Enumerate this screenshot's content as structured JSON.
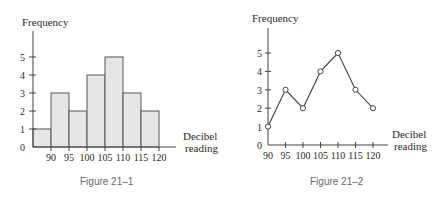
{
  "chart_data": [
    {
      "type": "bar",
      "subtype": "histogram",
      "title": "",
      "caption": "Figure 21–1",
      "xlabel": "Decibel reading",
      "ylabel": "Frequency",
      "categories": [
        "90",
        "95",
        "100",
        "105",
        "110",
        "115",
        "120"
      ],
      "values": [
        1,
        3,
        2,
        4,
        5,
        3,
        2
      ],
      "yticks": [
        "0",
        "1",
        "2",
        "3",
        "4",
        "5"
      ],
      "ylim": [
        0,
        5
      ],
      "grid": false,
      "legend": null,
      "bar_color": "#e6e6e6"
    },
    {
      "type": "line",
      "subtype": "frequency polygon",
      "title": "",
      "caption": "Figure 21–2",
      "xlabel": "Decibel reading",
      "ylabel": "Frequency",
      "x": [
        90,
        95,
        100,
        105,
        110,
        115,
        120
      ],
      "values": [
        1,
        3,
        2,
        4,
        5,
        3,
        2
      ],
      "xticks": [
        "90",
        "95",
        "100",
        "105",
        "110",
        "115",
        "120"
      ],
      "yticks": [
        "0",
        "1",
        "2",
        "3",
        "4",
        "5"
      ],
      "ylim": [
        0,
        5
      ],
      "grid": false,
      "legend": null,
      "markers": "open circles"
    }
  ],
  "figures": [
    {
      "ylabel": "Frequency",
      "xlabel_line1": "Decibel",
      "xlabel_line2": "reading",
      "caption": "Figure 21–1"
    },
    {
      "ylabel": "Frequency",
      "xlabel_line1": "Decibel",
      "xlabel_line2": "reading",
      "caption": "Figure 21–2"
    }
  ]
}
